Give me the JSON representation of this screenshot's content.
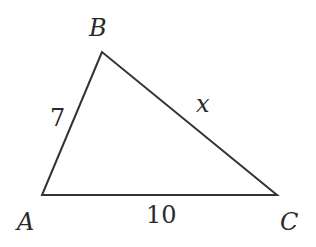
{
  "figure": {
    "type": "triangle",
    "stroke_color": "#333333",
    "vertices": {
      "A": {
        "label": "A",
        "x": 42,
        "y": 195
      },
      "B": {
        "label": "B",
        "x": 102,
        "y": 52
      },
      "C": {
        "label": "C",
        "x": 277,
        "y": 195
      }
    },
    "sides": {
      "AB": {
        "label": "7"
      },
      "AC": {
        "label": "10"
      },
      "BC": {
        "label": "x"
      }
    }
  }
}
